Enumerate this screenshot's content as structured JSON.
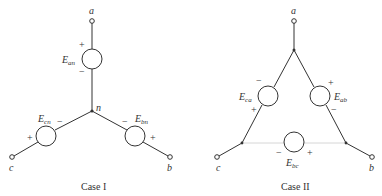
{
  "case1": {
    "caption": "Case I",
    "terminals": {
      "a": "a",
      "b": "b",
      "c": "c"
    },
    "neutral": "n",
    "sources": [
      {
        "id": "an",
        "symbol": "E",
        "subscript": "an",
        "plus": "+",
        "minus": "−"
      },
      {
        "id": "bn",
        "symbol": "E",
        "subscript": "bn",
        "plus": "+",
        "minus": "−"
      },
      {
        "id": "cn",
        "symbol": "E",
        "subscript": "cn",
        "plus": "+",
        "minus": "−"
      }
    ]
  },
  "case2": {
    "caption": "Case II",
    "terminals": {
      "a": "a",
      "b": "b",
      "c": "c"
    },
    "sources": [
      {
        "id": "ab",
        "symbol": "E",
        "subscript": "ab",
        "plus": "+",
        "minus": "−"
      },
      {
        "id": "bc",
        "symbol": "E",
        "subscript": "bc",
        "plus": "+",
        "minus": "−"
      },
      {
        "id": "ca",
        "symbol": "E",
        "subscript": "ca",
        "plus": "+",
        "minus": "−"
      }
    ]
  }
}
